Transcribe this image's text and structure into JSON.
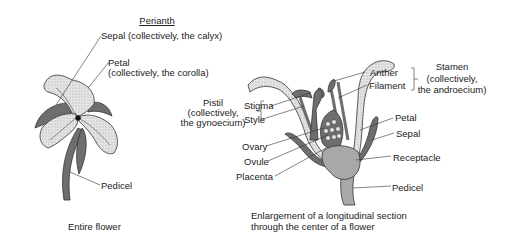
{
  "entire_flower": {
    "heading": "Perianth",
    "sepal_label": "Sepal (collectively, the calyx)",
    "petal_label_line1": "Petal",
    "petal_label_line2": "(collectively, the corolla)",
    "pedicel_label": "Pedicel",
    "caption": "Entire flower"
  },
  "section": {
    "pistil_line1": "Pistil",
    "pistil_line2": "(collectively,",
    "pistil_line3": "the gynoecium)",
    "stigma": "Stigma",
    "style": "Style",
    "ovary": "Ovary",
    "ovule": "Ovule",
    "placenta": "Placenta",
    "anther": "Anther",
    "filament": "Filament",
    "stamen_line1": "Stamen",
    "stamen_line2": "(collectively,",
    "stamen_line3": "the androecium)",
    "petal": "Petal",
    "sepal": "Sepal",
    "receptacle": "Receptacle",
    "pedicel": "Pedicel",
    "caption_line1": "Enlargement of a longitudinal section",
    "caption_line2": "through the center of a flower"
  },
  "colors": {
    "dark_fill": "#6e6e6e",
    "light_fill": "#d8d8d8",
    "mid_fill": "#a8a8a8",
    "line": "#333333"
  }
}
